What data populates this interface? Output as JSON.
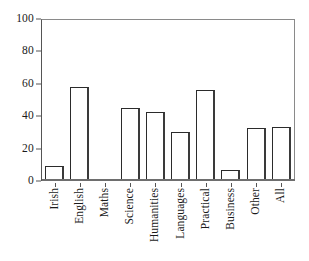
{
  "chart_data": {
    "type": "bar",
    "title": "",
    "subtitle": "",
    "xlabel": "",
    "ylabel": "",
    "categories": [
      "Irish",
      "English",
      "Maths",
      "Science",
      "Humanities",
      "Languages",
      "Practical",
      "Business",
      "Other",
      "All"
    ],
    "values": [
      9,
      58,
      0.5,
      45,
      42.5,
      30,
      56,
      7,
      33,
      33.5
    ],
    "series": [
      {
        "name": "",
        "values": [
          9,
          58,
          0.5,
          45,
          42.5,
          30,
          56,
          7,
          33,
          33.5
        ]
      }
    ],
    "ylim": [
      0,
      100
    ],
    "y_ticks": [
      0,
      20,
      40,
      60,
      80,
      100
    ],
    "y_tick_labels": [
      "0",
      "20",
      "40",
      "60",
      "80",
      "100"
    ],
    "grid": false,
    "legend": false,
    "legend_position": "none",
    "annotations": [],
    "bar_style": {
      "fill": "#ffffff",
      "edge": "#2b2b2b",
      "shadow": "#3a3a3a"
    },
    "axis_color": "#555555",
    "frame_color": "#8a8a8a",
    "background": "#ffffff"
  }
}
